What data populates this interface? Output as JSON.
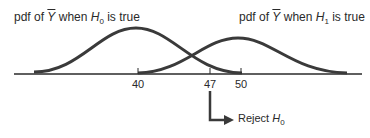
{
  "diagram": {
    "title_h0": {
      "prefix": "pdf of ",
      "var": "Y",
      "mid": " when ",
      "hyp": "H",
      "sub": "0",
      "suffix": " is true"
    },
    "title_h1": {
      "prefix": "pdf of ",
      "var": "Y",
      "mid": " when ",
      "hyp": "H",
      "sub": "1",
      "suffix": " is true"
    },
    "axis_ticks": [
      "40",
      "47",
      "50"
    ],
    "reject_label": {
      "text": "Reject ",
      "hyp": "H",
      "sub": "0"
    },
    "colors": {
      "curve": "#3a3a3a",
      "axis": "#2a2a2a"
    }
  }
}
